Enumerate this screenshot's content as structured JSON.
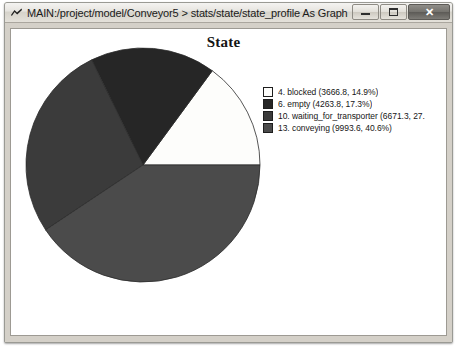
{
  "window": {
    "title": "MAIN:/project/model/Conveyor5 > stats/state/state_profile As Graph",
    "icon": "chart-app-icon",
    "buttons": {
      "minimize": "–",
      "maximize": "□",
      "close": "✕"
    }
  },
  "chart_data": {
    "type": "pie",
    "title": "State",
    "xlabel": "",
    "ylabel": "",
    "start_angle": 0,
    "direction": "counterclockwise",
    "legend_position": "right",
    "grid": false,
    "categories": [
      "4. blocked",
      "6. empty",
      "10. waiting_for_transporter",
      "13. conveying"
    ],
    "values": [
      3666.8,
      4263.8,
      6671.3,
      9993.6
    ],
    "percents": [
      14.9,
      17.3,
      27.1,
      40.6
    ],
    "colors": [
      "#fdfdfb",
      "#262626",
      "#3b3b3b",
      "#4b4b4b"
    ],
    "legend_labels": [
      "4. blocked (3666.8, 14.9%)",
      "6. empty (4263.8, 17.3%)",
      "10. waiting_for_transporter (6671.3, 27.",
      "13. conveying (9993.6, 40.6%)"
    ]
  }
}
